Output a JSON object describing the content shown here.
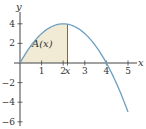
{
  "chart_data": {
    "type": "area",
    "title": "",
    "function": "y = x(4 - x)",
    "xlabel": "x",
    "ylabel": "y",
    "xlim": [
      0,
      5.6
    ],
    "ylim": [
      -6.5,
      5
    ],
    "x_ticks": [
      {
        "value": 1,
        "label": "1"
      },
      {
        "value": 2,
        "label": "2"
      },
      {
        "value": 2.2,
        "label": "x"
      },
      {
        "value": 3,
        "label": "3"
      },
      {
        "value": 4,
        "label": "4"
      },
      {
        "value": 5,
        "label": "5"
      }
    ],
    "y_ticks": [
      {
        "value": 4,
        "label": "4"
      },
      {
        "value": 2,
        "label": "2"
      },
      {
        "value": -2,
        "label": "−2"
      },
      {
        "value": -4,
        "label": "−4"
      },
      {
        "value": -6,
        "label": "−6"
      }
    ],
    "series": [
      {
        "name": "curve",
        "x": [
          0,
          0.5,
          1,
          1.5,
          2,
          2.5,
          3,
          3.5,
          4,
          4.5,
          5
        ],
        "values": [
          0,
          1.75,
          3,
          3.75,
          4,
          3.75,
          3,
          1.75,
          0,
          -2.25,
          -5
        ]
      }
    ],
    "shaded_region": {
      "label": "A(x)",
      "from": 0,
      "to": 2.2
    },
    "grid": false,
    "colors": {
      "curve": "#6b9fc2",
      "fill": "#f1ebd6",
      "marker": "#7a6a45",
      "axis": "#444444"
    }
  },
  "labels": {
    "x_axis": "x",
    "y_axis": "y",
    "area": "A(x)",
    "x_marker": "x"
  }
}
